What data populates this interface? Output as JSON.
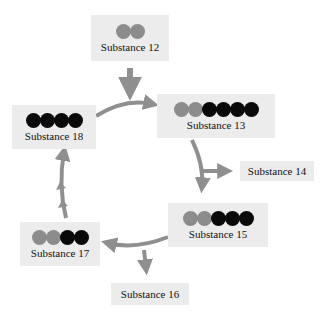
{
  "diagram": {
    "type": "reaction-cycle",
    "arrow_color": "#8f8f8f",
    "ball_colors": {
      "gray": "#8c8c8c",
      "black": "#0a0a0a"
    },
    "nodes": [
      {
        "id": "s12",
        "label": "Substance 12",
        "balls": [
          "gray",
          "gray"
        ]
      },
      {
        "id": "s13",
        "label": "Substance 13",
        "balls": [
          "gray",
          "gray",
          "black",
          "black",
          "black",
          "black"
        ]
      },
      {
        "id": "s14",
        "label": "Substance 14",
        "balls": []
      },
      {
        "id": "s15",
        "label": "Substance 15",
        "balls": [
          "gray",
          "gray",
          "black",
          "black",
          "black"
        ]
      },
      {
        "id": "s16",
        "label": "Substance 16",
        "balls": []
      },
      {
        "id": "s17",
        "label": "Substance 17",
        "balls": [
          "gray",
          "gray",
          "black",
          "black"
        ]
      },
      {
        "id": "s18",
        "label": "Substance 18",
        "balls": [
          "black",
          "black",
          "black",
          "black"
        ]
      }
    ],
    "edges": [
      {
        "from": "s12",
        "to": "s13"
      },
      {
        "from": "s18",
        "to": "s13"
      },
      {
        "from": "s13",
        "to": "s14"
      },
      {
        "from": "s13",
        "to": "s15"
      },
      {
        "from": "s15",
        "to": "s16"
      },
      {
        "from": "s15",
        "to": "s17"
      },
      {
        "from": "s17",
        "to": "s18"
      }
    ]
  }
}
